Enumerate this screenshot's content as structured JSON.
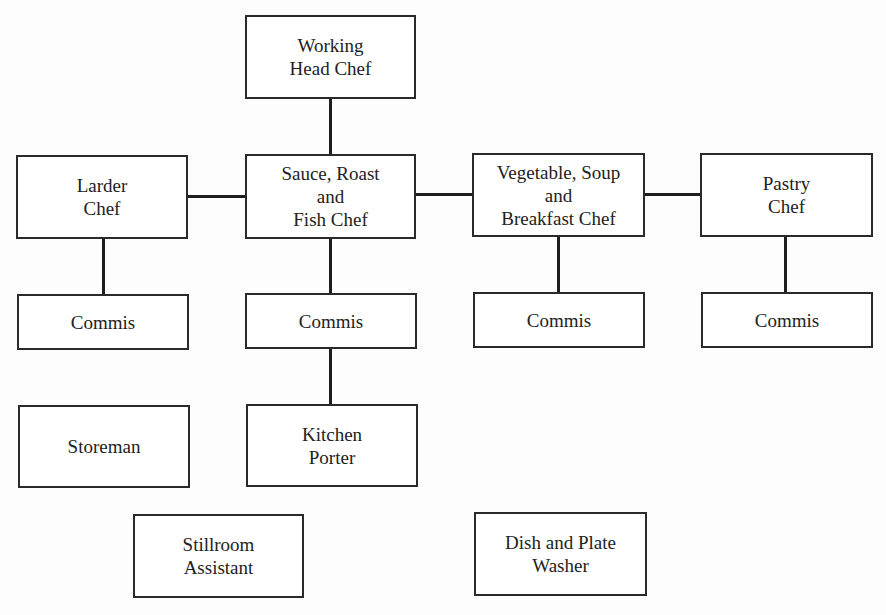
{
  "diagram": {
    "type": "organization-chart",
    "nodes": {
      "head_chef": {
        "label": "Working\nHead Chef"
      },
      "larder_chef": {
        "label": "Larder\nChef"
      },
      "sauce_chef": {
        "label": "Sauce, Roast\nand\nFish Chef"
      },
      "vegetable_chef": {
        "label": "Vegetable, Soup\nand\nBreakfast Chef"
      },
      "pastry_chef": {
        "label": "Pastry\nChef"
      },
      "commis_larder": {
        "label": "Commis"
      },
      "commis_sauce": {
        "label": "Commis"
      },
      "commis_vegetable": {
        "label": "Commis"
      },
      "commis_pastry": {
        "label": "Commis"
      },
      "storeman": {
        "label": "Storeman"
      },
      "kitchen_porter": {
        "label": "Kitchen\nPorter"
      },
      "stillroom_assistant": {
        "label": "Stillroom\nAssistant"
      },
      "dish_plate_washer": {
        "label": "Dish and Plate\nWasher"
      }
    },
    "edges": [
      [
        "head_chef",
        "sauce_chef"
      ],
      [
        "larder_chef",
        "sauce_chef"
      ],
      [
        "sauce_chef",
        "vegetable_chef"
      ],
      [
        "vegetable_chef",
        "pastry_chef"
      ],
      [
        "larder_chef",
        "commis_larder"
      ],
      [
        "sauce_chef",
        "commis_sauce"
      ],
      [
        "vegetable_chef",
        "commis_vegetable"
      ],
      [
        "pastry_chef",
        "commis_pastry"
      ],
      [
        "commis_sauce",
        "kitchen_porter"
      ]
    ],
    "colors": {
      "line": "#1e1e1e",
      "border": "#2a2a2a",
      "text": "#222222",
      "background": "#ffffff"
    }
  }
}
